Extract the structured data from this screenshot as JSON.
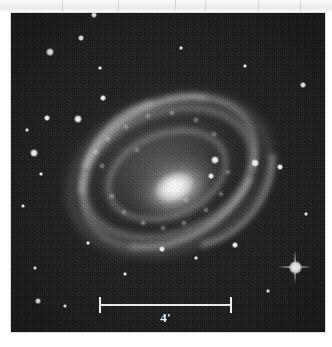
{
  "figure": {
    "kind": "astronomical-plate",
    "background_color": "#1b1b1b",
    "page_color": "#ffffff"
  },
  "scale_bar": {
    "label": "4'",
    "unit": "arcminutes",
    "value": 4,
    "x_start": 99,
    "x_end": 232,
    "y": 304,
    "length_px": 133,
    "color": "#efefef"
  },
  "plate": {
    "left": 11,
    "top": 13,
    "width": 314,
    "height": 319
  },
  "scan_band": {
    "height": 11,
    "seams": [
      62,
      118,
      175,
      205,
      258,
      300
    ]
  },
  "galaxy": {
    "nucleus_x": 165,
    "nucleus_y": 179,
    "position_angle_deg": -22,
    "knots": [
      {
        "x": 96,
        "y": 152,
        "r": 2.0,
        "a": 0.55
      },
      {
        "x": 102,
        "y": 166,
        "r": 1.8,
        "a": 0.5
      },
      {
        "x": 112,
        "y": 196,
        "r": 2.2,
        "a": 0.52
      },
      {
        "x": 124,
        "y": 212,
        "r": 2.0,
        "a": 0.48
      },
      {
        "x": 143,
        "y": 223,
        "r": 2.4,
        "a": 0.55
      },
      {
        "x": 163,
        "y": 228,
        "r": 2.0,
        "a": 0.5
      },
      {
        "x": 184,
        "y": 223,
        "r": 2.2,
        "a": 0.52
      },
      {
        "x": 206,
        "y": 210,
        "r": 2.3,
        "a": 0.5
      },
      {
        "x": 221,
        "y": 194,
        "r": 2.0,
        "a": 0.46
      },
      {
        "x": 228,
        "y": 172,
        "r": 1.9,
        "a": 0.44
      },
      {
        "x": 214,
        "y": 134,
        "r": 2.1,
        "a": 0.48
      },
      {
        "x": 196,
        "y": 120,
        "r": 2.3,
        "a": 0.52
      },
      {
        "x": 172,
        "y": 113,
        "r": 2.2,
        "a": 0.5
      },
      {
        "x": 148,
        "y": 116,
        "r": 2.0,
        "a": 0.46
      },
      {
        "x": 126,
        "y": 127,
        "r": 2.1,
        "a": 0.48
      },
      {
        "x": 108,
        "y": 139,
        "r": 1.9,
        "a": 0.44
      },
      {
        "x": 186,
        "y": 200,
        "r": 1.7,
        "a": 0.42
      },
      {
        "x": 137,
        "y": 150,
        "r": 1.6,
        "a": 0.4
      }
    ]
  },
  "stars": [
    {
      "x": 94,
      "y": 15,
      "r": 2.6
    },
    {
      "x": 81,
      "y": 38,
      "r": 2.4
    },
    {
      "x": 50,
      "y": 52,
      "r": 2.8
    },
    {
      "x": 100,
      "y": 68,
      "r": 1.8
    },
    {
      "x": 103,
      "y": 98,
      "r": 2.0
    },
    {
      "x": 47,
      "y": 118,
      "r": 2.4
    },
    {
      "x": 78,
      "y": 119,
      "r": 3.0
    },
    {
      "x": 27,
      "y": 130,
      "r": 1.9
    },
    {
      "x": 34,
      "y": 153,
      "r": 2.8
    },
    {
      "x": 41,
      "y": 174,
      "r": 1.7
    },
    {
      "x": 23,
      "y": 206,
      "r": 1.6
    },
    {
      "x": 35,
      "y": 268,
      "r": 1.8
    },
    {
      "x": 38,
      "y": 301,
      "r": 2.2
    },
    {
      "x": 65,
      "y": 306,
      "r": 1.7
    },
    {
      "x": 181,
      "y": 48,
      "r": 1.6
    },
    {
      "x": 245,
      "y": 66,
      "r": 1.5
    },
    {
      "x": 303,
      "y": 85,
      "r": 2.1
    },
    {
      "x": 215,
      "y": 160,
      "r": 3.0
    },
    {
      "x": 211,
      "y": 176,
      "r": 2.0
    },
    {
      "x": 255,
      "y": 163,
      "r": 3.2
    },
    {
      "x": 280,
      "y": 167,
      "r": 2.6
    },
    {
      "x": 235,
      "y": 245,
      "r": 2.2
    },
    {
      "x": 162,
      "y": 249,
      "r": 2.0
    },
    {
      "x": 196,
      "y": 258,
      "r": 1.7
    },
    {
      "x": 268,
      "y": 291,
      "r": 1.6
    },
    {
      "x": 125,
      "y": 274,
      "r": 1.5
    },
    {
      "x": 88,
      "y": 243,
      "r": 1.5
    },
    {
      "x": 306,
      "y": 214,
      "r": 1.6
    }
  ],
  "bright_star": {
    "x": 295,
    "y": 267,
    "has_diffraction_spikes": true,
    "spike_length_px": 34
  }
}
